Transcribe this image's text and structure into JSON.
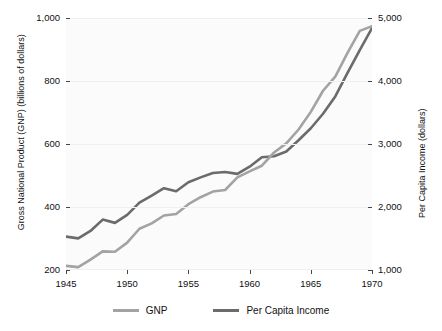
{
  "chart_data": {
    "type": "line",
    "title": "",
    "xlabel": "",
    "ylabel": "Gross National Product (GNP) (billions of dollars)",
    "y2label": "Per Capita Income (dollars)",
    "x": [
      1945,
      1946,
      1947,
      1948,
      1949,
      1950,
      1951,
      1952,
      1953,
      1954,
      1955,
      1956,
      1957,
      1958,
      1959,
      1960,
      1961,
      1962,
      1963,
      1964,
      1965,
      1966,
      1967,
      1968,
      1969,
      1970
    ],
    "xlim": [
      1945,
      1970
    ],
    "ylim": [
      200,
      1000
    ],
    "y2lim": [
      1000,
      5000
    ],
    "xticks": [
      "1945",
      "1950",
      "1955",
      "1960",
      "1965",
      "1970"
    ],
    "xtick_values": [
      1945,
      1950,
      1955,
      1960,
      1965,
      1970
    ],
    "yticks": [
      "200",
      "400",
      "600",
      "800",
      "1,000"
    ],
    "ytick_values": [
      200,
      400,
      600,
      800,
      1000
    ],
    "y2ticks": [
      "1,000",
      "2,000",
      "3,000",
      "4,000",
      "5,000"
    ],
    "y2tick_values": [
      1000,
      2000,
      3000,
      4000,
      5000
    ],
    "grid": true,
    "legend_position": "bottom",
    "series": [
      {
        "name": "GNP",
        "axis": "left",
        "color": "#a3a3a3",
        "values": [
          213,
          209,
          233,
          259,
          258,
          287,
          331,
          348,
          373,
          378,
          409,
          431,
          449,
          454,
          494,
          513,
          531,
          573,
          602,
          646,
          702,
          769,
          814,
          889,
          959,
          974
        ]
      },
      {
        "name": "Per Capita Income",
        "axis": "right",
        "color": "#6b6b6b",
        "values": [
          1530,
          1502,
          1620,
          1800,
          1748,
          1875,
          2070,
          2180,
          2298,
          2250,
          2392,
          2470,
          2540,
          2555,
          2526,
          2640,
          2790,
          2805,
          2880,
          3060,
          3250,
          3480,
          3755,
          4130,
          4490,
          4840
        ]
      }
    ],
    "legend": [
      {
        "label": "GNP",
        "color": "#a3a3a3"
      },
      {
        "label": "Per Capita Income",
        "color": "#6b6b6b"
      }
    ]
  }
}
